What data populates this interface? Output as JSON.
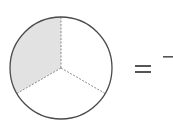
{
  "diagram": {
    "type": "fraction-circle",
    "total_parts": 3,
    "shaded_parts": 1,
    "colors": {
      "outline": "#4a4a4a",
      "divider": "#8a8a8a",
      "shaded": "#e2e2e2",
      "unshaded": "#ffffff",
      "symbol": "#555555"
    },
    "equation": {
      "operator": "=",
      "fraction": {
        "numerator": "",
        "denominator": ""
      }
    }
  }
}
